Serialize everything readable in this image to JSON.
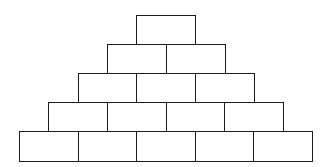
{
  "diagram": {
    "title": "",
    "type": "brick-pyramid",
    "rows": [
      {
        "row": 1,
        "bricks": 1
      },
      {
        "row": 2,
        "bricks": 2
      },
      {
        "row": 3,
        "bricks": 3
      },
      {
        "row": 4,
        "bricks": 4
      },
      {
        "row": 5,
        "bricks": 5
      }
    ],
    "brick_labels": [],
    "colors": {
      "stroke": "#1a1a1a",
      "fill": "#ffffff"
    }
  }
}
